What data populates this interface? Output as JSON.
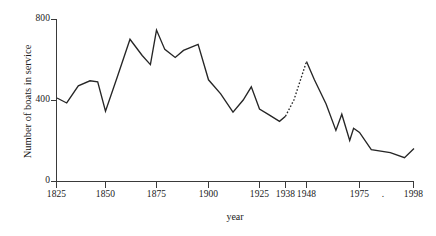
{
  "chart_data": {
    "type": "line",
    "title": "",
    "xlabel": "year",
    "ylabel": "Number of boats in service",
    "ylim": [
      0,
      800
    ],
    "y_ticks": [
      0,
      400,
      800
    ],
    "y_tick_labels": [
      "0",
      "400",
      "800"
    ],
    "x_ticks": [
      1825,
      1850,
      1875,
      1900,
      1925,
      1938,
      1948,
      1975,
      1998
    ],
    "x_tick_labels": [
      "1825",
      "1850",
      "1875",
      "1900",
      "1925",
      "1938",
      "1948",
      "1975",
      "1998"
    ],
    "grid": false,
    "legend": null,
    "stray_mark": ".",
    "series": [
      {
        "name": "Number of boats in service",
        "style": "solid",
        "x": [
          1825,
          1830,
          1836,
          1842,
          1846,
          1850,
          1856,
          1862,
          1868,
          1872,
          1875,
          1879,
          1884,
          1888,
          1895,
          1900,
          1906,
          1912,
          1917,
          1921,
          1925,
          1930,
          1935,
          1938
        ],
        "values": [
          410,
          385,
          470,
          495,
          490,
          345,
          520,
          700,
          620,
          575,
          745,
          650,
          610,
          645,
          675,
          500,
          430,
          340,
          400,
          465,
          355,
          325,
          295,
          320
        ]
      },
      {
        "name": "Number of boats in service (estimated)",
        "style": "dotted",
        "x": [
          1938,
          1942,
          1948
        ],
        "values": [
          320,
          400,
          590
        ]
      },
      {
        "name": "Number of boats in service (postwar)",
        "style": "solid",
        "x": [
          1948,
          1952,
          1958,
          1963,
          1966,
          1970,
          1972,
          1975,
          1980,
          1988,
          1994,
          1998
        ],
        "values": [
          590,
          500,
          380,
          250,
          330,
          200,
          260,
          240,
          155,
          140,
          115,
          160
        ]
      }
    ]
  },
  "axis": {
    "x_title": "year",
    "y_title": "Number of boats in service"
  }
}
